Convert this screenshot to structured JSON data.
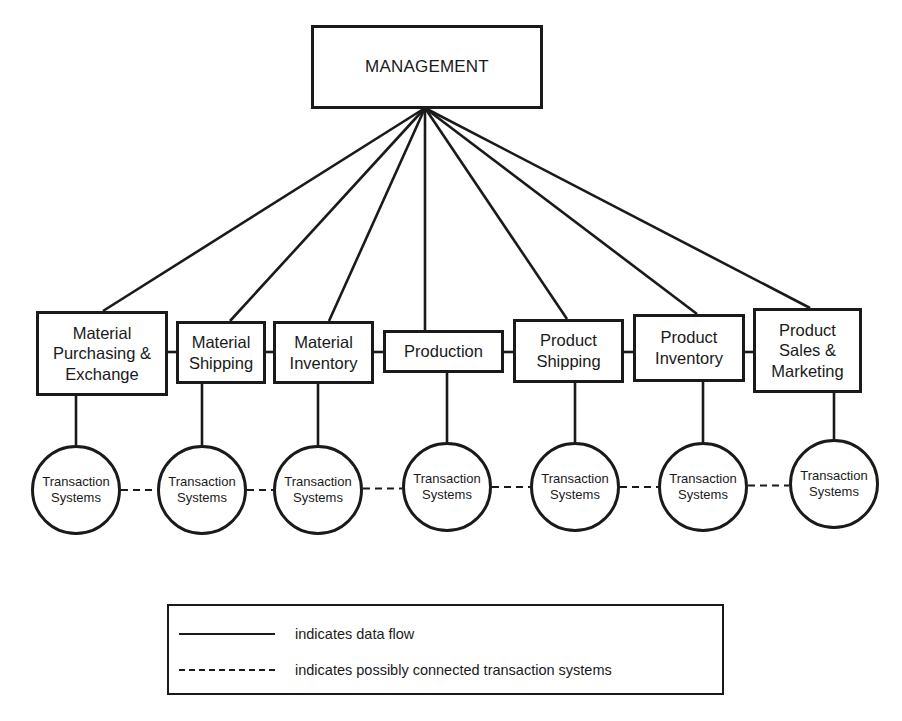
{
  "diagram": {
    "colors": {
      "stroke": "#1a1a1a",
      "background": "#ffffff"
    },
    "management": {
      "label": "MANAGEMENT",
      "box": {
        "x": 311,
        "y": 25,
        "w": 232,
        "h": 84
      },
      "hub": {
        "x": 425,
        "y": 108
      }
    },
    "departments": [
      {
        "id": "material-purchasing-exchange",
        "label": "Material\nPurchasing &\nExchange",
        "box": {
          "x": 36,
          "y": 311,
          "w": 132,
          "h": 85
        },
        "attach_top_x": 103,
        "drop_x": 76
      },
      {
        "id": "material-shipping",
        "label": "Material\nShipping",
        "box": {
          "x": 176,
          "y": 321,
          "w": 90,
          "h": 63
        },
        "attach_top_x": 230,
        "drop_x": 202
      },
      {
        "id": "material-inventory",
        "label": "Material\nInventory",
        "box": {
          "x": 273,
          "y": 321,
          "w": 101,
          "h": 63
        },
        "attach_top_x": 329,
        "drop_x": 318
      },
      {
        "id": "production",
        "label": "Production",
        "box": {
          "x": 383,
          "y": 330,
          "w": 121,
          "h": 43
        },
        "attach_top_x": 425,
        "drop_x": 447
      },
      {
        "id": "product-shipping",
        "label": "Product\nShipping",
        "box": {
          "x": 513,
          "y": 319,
          "w": 111,
          "h": 64
        },
        "attach_top_x": 567,
        "drop_x": 575
      },
      {
        "id": "product-inventory",
        "label": "Product\nInventory",
        "box": {
          "x": 633,
          "y": 314,
          "w": 112,
          "h": 68
        },
        "attach_top_x": 697,
        "drop_x": 703
      },
      {
        "id": "product-sales-marketing",
        "label": "Product\nSales &\nMarketing",
        "box": {
          "x": 753,
          "y": 308,
          "w": 109,
          "h": 85
        },
        "attach_top_x": 810,
        "drop_x": 834
      }
    ],
    "connector_y": 352,
    "transaction_systems": [
      {
        "label": "Transaction\nSystems",
        "cx": 76,
        "cy": 490,
        "r": 45
      },
      {
        "label": "Transaction\nSystems",
        "cx": 202,
        "cy": 490,
        "r": 45
      },
      {
        "label": "Transaction\nSystems",
        "cx": 318,
        "cy": 490,
        "r": 45
      },
      {
        "label": "Transaction\nSystems",
        "cx": 447,
        "cy": 487,
        "r": 45
      },
      {
        "label": "Transaction\nSystems",
        "cx": 575,
        "cy": 487,
        "r": 45
      },
      {
        "label": "Transaction\nSystems",
        "cx": 703,
        "cy": 487,
        "r": 45
      },
      {
        "label": "Transaction\nSystems",
        "cx": 834,
        "cy": 484,
        "r": 45
      }
    ],
    "legend": {
      "items": [
        {
          "style": "solid",
          "label": "indicates data flow"
        },
        {
          "style": "dashed",
          "label": "indicates possibly connected transaction systems"
        }
      ]
    }
  }
}
